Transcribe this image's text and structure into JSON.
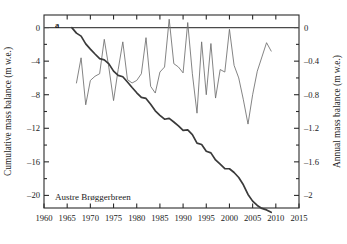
{
  "figure": {
    "panel_label": "a",
    "series_label": "Austre Brøggerbreen",
    "background": "#ffffff"
  },
  "axes": {
    "left": {
      "title": "Cumulative mass balance (m w.e.)",
      "ticks": [
        "0",
        "–4",
        "–8",
        "–12",
        "–16",
        "–20"
      ],
      "tick_values": [
        0,
        -4,
        -8,
        -12,
        -16,
        -20
      ],
      "range": [
        -21.5,
        1.5
      ],
      "minor_tick_step": 2
    },
    "right": {
      "title": "Annual mass balance (m w.e.)",
      "ticks": [
        "0",
        "–0.4",
        "–0.8",
        "–1.2",
        "–1.6",
        "–2"
      ],
      "tick_values": [
        0,
        -0.4,
        -0.8,
        -1.2,
        -1.6,
        -2
      ],
      "range": [
        -2.15,
        0.15
      ],
      "minor_tick_step": 0.2
    },
    "bottom": {
      "title": "",
      "ticks": [
        "1960",
        "1965",
        "1970",
        "1975",
        "1980",
        "1985",
        "1990",
        "1995",
        "2000",
        "2005",
        "2010",
        "2015"
      ],
      "tick_values": [
        1960,
        1965,
        1970,
        1975,
        1980,
        1985,
        1990,
        1995,
        2000,
        2005,
        2010,
        2015
      ],
      "range": [
        1960,
        2015
      ]
    }
  },
  "chart_data": {
    "type": "line",
    "title": "Austre Brøggerbreen",
    "xlabel": "",
    "ylabel": "Cumulative mass balance (m w.e.)",
    "ylabel_right": "Annual mass balance (m w.e.)",
    "xlim": [
      1960,
      2015
    ],
    "ylim": [
      -21.5,
      1.5
    ],
    "ylim_right": [
      -2.15,
      0.15
    ],
    "grid": false,
    "legend": "none",
    "annotations": [
      "a",
      "Austre Brøggerbreen"
    ],
    "colors": {
      "cumulative": "#3a3a3a",
      "annual": "#6e6e6e"
    },
    "series": [
      {
        "name": "Annual mass balance",
        "axis": "right",
        "units": "m w.e.",
        "x": [
          1967,
          1968,
          1969,
          1970,
          1971,
          1972,
          1973,
          1974,
          1975,
          1976,
          1977,
          1978,
          1979,
          1980,
          1981,
          1982,
          1983,
          1984,
          1985,
          1986,
          1987,
          1988,
          1989,
          1990,
          1991,
          1992,
          1993,
          1994,
          1995,
          1996,
          1997,
          1998,
          1999,
          2000,
          2001,
          2002,
          2003,
          2004,
          2005,
          2006,
          2007,
          2008,
          2009
        ],
        "values": [
          -0.66,
          -0.36,
          -0.92,
          -0.63,
          -0.58,
          -0.55,
          -0.14,
          -0.48,
          -0.87,
          -0.5,
          -0.17,
          -0.62,
          -0.66,
          -0.63,
          -0.55,
          -0.12,
          -0.7,
          -0.78,
          -0.53,
          -0.47,
          0.1,
          -0.43,
          -0.47,
          -0.54,
          0.06,
          -0.55,
          -1.02,
          -0.17,
          -0.8,
          -0.19,
          -0.84,
          -0.5,
          -0.53,
          -0.02,
          -0.45,
          -0.6,
          -0.86,
          -1.15,
          -0.8,
          -0.52,
          -0.35,
          -0.18,
          -0.28
        ]
      },
      {
        "name": "Cumulative mass balance",
        "axis": "left",
        "units": "m w.e.",
        "x": [
          1966,
          1967,
          1968,
          1969,
          1970,
          1971,
          1972,
          1973,
          1974,
          1975,
          1976,
          1977,
          1978,
          1979,
          1980,
          1981,
          1982,
          1983,
          1984,
          1985,
          1986,
          1987,
          1988,
          1989,
          1990,
          1991,
          1992,
          1993,
          1994,
          1995,
          1996,
          1997,
          1998,
          1999,
          2000,
          2001,
          2002,
          2003,
          2004,
          2005,
          2006,
          2007,
          2008,
          2009
        ],
        "values": [
          0.0,
          -0.66,
          -1.02,
          -1.94,
          -2.57,
          -3.15,
          -3.7,
          -3.84,
          -4.32,
          -5.19,
          -5.69,
          -5.86,
          -6.48,
          -7.14,
          -7.77,
          -8.32,
          -8.44,
          -9.14,
          -9.92,
          -10.45,
          -10.92,
          -10.82,
          -11.25,
          -11.72,
          -12.26,
          -12.2,
          -12.75,
          -13.77,
          -13.94,
          -14.74,
          -14.93,
          -15.77,
          -16.27,
          -16.8,
          -16.82,
          -17.27,
          -17.87,
          -18.73,
          -19.88,
          -20.68,
          -21.2,
          -21.55,
          -21.73,
          -22.01
        ]
      }
    ]
  }
}
